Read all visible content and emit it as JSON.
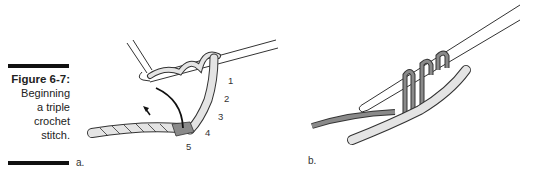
{
  "figure": {
    "title": "Figure 6-7:",
    "caption_lines": [
      "Beginning",
      "a triple",
      "crochet",
      "stitch."
    ]
  },
  "panels": [
    {
      "label": "a.",
      "step_numbers": [
        "1",
        "2",
        "3",
        "4",
        "5"
      ]
    },
    {
      "label": "b."
    }
  ],
  "colors": {
    "yarn_light": "#e4e4e4",
    "yarn_dark": "#8a8a8a",
    "outline": "#333333",
    "caption_bar": "#111111"
  }
}
